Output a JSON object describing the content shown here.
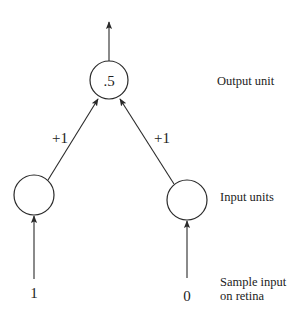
{
  "diagram": {
    "output_unit": {
      "value": ".5",
      "label": "Output unit"
    },
    "input_units": {
      "label": "Input units",
      "left_value": "",
      "right_value": ""
    },
    "weights": {
      "left": "+1",
      "right": "+1"
    },
    "sample_input": {
      "label_line1": "Sample input",
      "label_line2": "on retina",
      "left": "1",
      "right": "0"
    },
    "colors": {
      "stroke": "#2a2a2a",
      "text": "#222222",
      "background": "#ffffff"
    }
  }
}
